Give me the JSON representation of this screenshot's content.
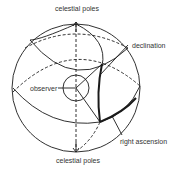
{
  "diagram": {
    "labels": {
      "top_pole": "celestial poles",
      "bottom_pole": "celestial poles",
      "declination": "declination",
      "observer": "observer",
      "right_ascension": "right ascension"
    },
    "colors": {
      "line": "#1a1a1a",
      "text": "#333333",
      "background": "#ffffff"
    }
  }
}
